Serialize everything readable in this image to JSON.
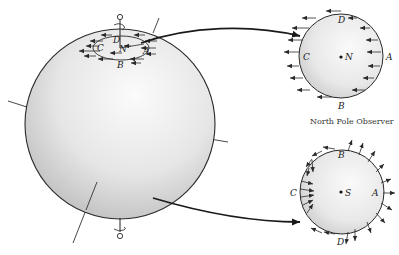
{
  "figure": {
    "type": "Earth rotation / Coriolis viewpoint diagram",
    "globe": {
      "pole_labels_local": {
        "A": "A",
        "B": "B",
        "C": "C",
        "D": "D",
        "pole": "N"
      }
    },
    "north_view": {
      "labels": {
        "A": "A",
        "B": "B",
        "C": "C",
        "D": "D",
        "center": "N"
      },
      "caption": "North Pole Observer"
    },
    "south_view": {
      "labels": {
        "A": "A",
        "B": "B",
        "C": "C",
        "D": "D",
        "center": "S"
      }
    },
    "colors": {
      "ink": "#2a2a2a",
      "sphere_light": "#f4f4f4",
      "sphere_dark": "#bdbdbd",
      "background": "#ffffff"
    }
  }
}
